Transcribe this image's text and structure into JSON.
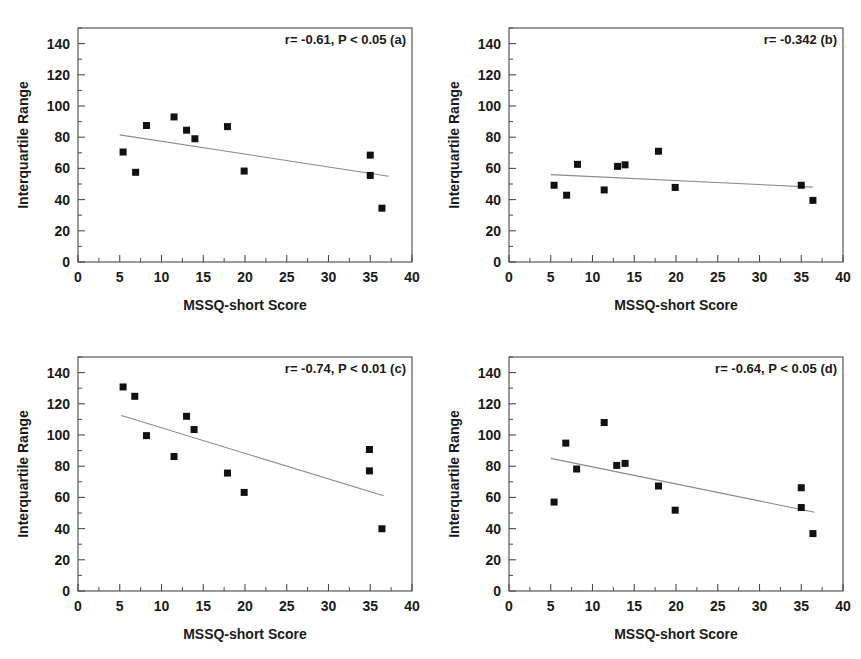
{
  "figure": {
    "name": "mssq-iqr-correlation-figure",
    "panel_count": 4,
    "marker_color": "#111111",
    "line_color": "#8a8a8a",
    "axis_color": "#4a4a4a",
    "background": "#ffffff"
  },
  "axes": {
    "xlabel": "MSSQ-short Score",
    "ylabel": "Interquartile Range",
    "xlim": [
      0,
      40
    ],
    "ylim": [
      0,
      150
    ],
    "xticks": [
      0,
      5,
      10,
      15,
      20,
      25,
      30,
      35,
      40
    ],
    "xtick_labels": [
      "0",
      "5",
      "10",
      "15",
      "20",
      "25",
      "30",
      "35",
      "40"
    ],
    "yticks": [
      0,
      20,
      40,
      60,
      80,
      100,
      120,
      140
    ],
    "ytick_labels": [
      "0",
      "20",
      "40",
      "60",
      "80",
      "100",
      "120",
      "140"
    ],
    "x_minor_step": 2.5,
    "y_minor_step": 10,
    "grid": false,
    "frame": "box",
    "tick_direction": "in"
  },
  "chart_data": [
    {
      "id": "a",
      "type": "scatter",
      "title": "",
      "annotation": "r= -0.61, P < 0.05 (a)",
      "r": -0.61,
      "p_text": "P < 0.05",
      "panel_label": "(a)",
      "xlabel": "MSSQ-short Score",
      "ylabel": "Interquartile Range",
      "xlim": [
        0,
        40
      ],
      "ylim": [
        0,
        150
      ],
      "x": [
        5.4,
        6.9,
        8.2,
        11.5,
        13.0,
        14.0,
        17.9,
        19.9,
        35.0,
        35.0,
        36.4
      ],
      "y": [
        70.5,
        57.5,
        87.5,
        93.0,
        84.5,
        79.0,
        86.8,
        58.3,
        68.5,
        55.5,
        34.5
      ],
      "fit_line": {
        "x0": 5.0,
        "y0": 81.5,
        "x1": 37.2,
        "y1": 55.0
      }
    },
    {
      "id": "b",
      "type": "scatter",
      "title": "",
      "annotation": "r= -0.342 (b)",
      "r": -0.342,
      "p_text": "",
      "panel_label": "(b)",
      "xlabel": "MSSQ-short Score",
      "ylabel": "Interquartile Range",
      "xlim": [
        0,
        40
      ],
      "ylim": [
        0,
        150
      ],
      "x": [
        5.4,
        6.9,
        8.2,
        11.4,
        13.0,
        13.9,
        17.9,
        19.9,
        35.0,
        36.4
      ],
      "y": [
        49.2,
        42.8,
        62.6,
        46.2,
        61.3,
        62.3,
        71.0,
        47.8,
        49.2,
        39.5
      ],
      "fit_line": {
        "x0": 5.0,
        "y0": 56.0,
        "x1": 36.4,
        "y1": 48.0
      }
    },
    {
      "id": "c",
      "type": "scatter",
      "title": "",
      "annotation": "r= -0.74, P < 0.01 (c)",
      "r": -0.74,
      "p_text": "P < 0.01",
      "panel_label": "(c)",
      "xlabel": "MSSQ-short Score",
      "ylabel": "Interquartile Range",
      "xlim": [
        0,
        40
      ],
      "ylim": [
        0,
        150
      ],
      "x": [
        5.4,
        6.8,
        8.2,
        11.5,
        13.0,
        13.9,
        17.9,
        19.9,
        34.9,
        34.9,
        36.4
      ],
      "y": [
        130.8,
        124.8,
        99.6,
        86.2,
        112.0,
        103.5,
        75.6,
        63.2,
        90.7,
        77.0,
        39.9
      ],
      "fit_line": {
        "x0": 5.2,
        "y0": 112.5,
        "x1": 36.6,
        "y1": 61.0
      }
    },
    {
      "id": "d",
      "type": "scatter",
      "title": "",
      "annotation": "r= -0.64, P < 0.05 (d)",
      "r": -0.64,
      "p_text": "P < 0.05",
      "panel_label": "(d)",
      "xlabel": "MSSQ-short Score",
      "ylabel": "Interquartile Range",
      "xlim": [
        0,
        40
      ],
      "ylim": [
        0,
        150
      ],
      "x": [
        5.4,
        6.8,
        8.1,
        11.4,
        12.9,
        13.9,
        17.9,
        19.9,
        35.0,
        35.0,
        36.4
      ],
      "y": [
        57.0,
        94.8,
        78.2,
        108.0,
        80.5,
        81.8,
        67.3,
        51.8,
        66.2,
        53.5,
        36.8
      ],
      "fit_line": {
        "x0": 5.0,
        "y0": 85.0,
        "x1": 36.6,
        "y1": 50.5
      }
    }
  ]
}
